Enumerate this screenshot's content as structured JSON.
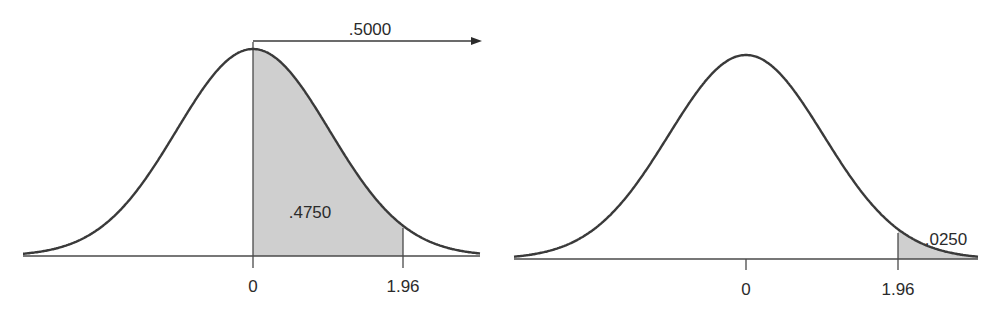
{
  "chart_data": [
    {
      "type": "area",
      "title": "",
      "description": "Standard normal curve with area between 0 and 1.96 shaded",
      "xlabel": "",
      "ylabel": "",
      "x_ticks": [
        "0",
        "1.96"
      ],
      "shaded_region": {
        "from": 0,
        "to": 1.96,
        "area_label": ".4750"
      },
      "annotation": {
        "label": ".5000",
        "from": 0,
        "direction": "right-arrow"
      },
      "grid": false,
      "legend": null
    },
    {
      "type": "area",
      "title": "",
      "description": "Standard normal curve with right tail beyond 1.96 shaded",
      "xlabel": "",
      "ylabel": "",
      "x_ticks": [
        "0",
        "1.96"
      ],
      "shaded_region": {
        "from": 1.96,
        "to": "inf",
        "area_label": ".0250"
      },
      "grid": false,
      "legend": null
    }
  ],
  "left": {
    "tick_zero": "0",
    "tick_z": "1.96",
    "area_label": ".4750",
    "arrow_label": ".5000"
  },
  "right": {
    "tick_zero": "0",
    "tick_z": "1.96",
    "area_label": ".0250"
  },
  "colors": {
    "curve": "#3a3a3a",
    "shade": "#cfcfcf",
    "axis": "#4a4a4a"
  }
}
